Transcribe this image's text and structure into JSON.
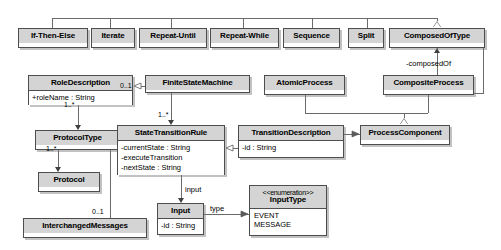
{
  "diagram": {
    "colors": {
      "header_fill": "#d4d4d4",
      "body_fill": "#ffffff",
      "border": "#4d4d4d",
      "connector": "#6b6b6b",
      "text": "#000000"
    }
  },
  "classes": {
    "if_then_else": {
      "name": "If-Then-Else"
    },
    "iterate": {
      "name": "Iterate"
    },
    "repeat_until": {
      "name": "Repeat-Until"
    },
    "repeat_while": {
      "name": "Repeat-While"
    },
    "sequence": {
      "name": "Sequence"
    },
    "split": {
      "name": "Split"
    },
    "composed_of_type": {
      "name": "ComposedOfType"
    },
    "role_description": {
      "name": "RoleDescription",
      "attributes": [
        "+roleName : String"
      ]
    },
    "finite_state_machine": {
      "name": "FiniteStateMachine"
    },
    "atomic_process": {
      "name": "AtomicProcess"
    },
    "composite_process": {
      "name": "CompositeProcess"
    },
    "protocol_type": {
      "name": "ProtocolType"
    },
    "state_transition_rule": {
      "name": "StateTransitionRule",
      "attributes": [
        "-currentState : String",
        "-executeTransition",
        "-nextState : String"
      ]
    },
    "transition_description": {
      "name": "TransitionDescription",
      "attributes": [
        "-id : String"
      ]
    },
    "process_component": {
      "name": "ProcessComponent"
    },
    "protocol": {
      "name": "Protocol"
    },
    "interchanged_messages": {
      "name": "InterchangedMessages"
    },
    "input": {
      "name": "Input",
      "attributes": [
        "-id : String"
      ]
    },
    "input_type": {
      "stereotype": "<<enumeration>>",
      "name": "InputType",
      "literals": [
        "EVENT",
        "MESSAGE"
      ]
    }
  },
  "labels": {
    "composed_of": "-composedOf",
    "input_role": "input",
    "type_role": "type"
  },
  "multiplicities": {
    "fsm_to_role": "0..1",
    "role_to_protocoltype": "1..*",
    "protocoltype_to_protocol": "1..*",
    "fsm_to_str": "1..*",
    "protocoltype_to_interchanged": "0..1"
  }
}
